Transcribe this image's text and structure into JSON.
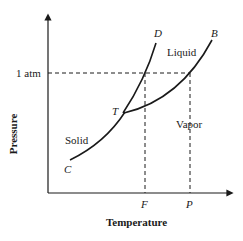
{
  "diagram": {
    "type": "phase-diagram",
    "axes": {
      "xlabel": "Temperature",
      "ylabel": "Pressure",
      "y_tick": "1 atm",
      "x_ticks": [
        "F",
        "P"
      ]
    },
    "regions": {
      "solid": "Solid",
      "liquid": "Liquid",
      "vapor": "Vapor"
    },
    "points": {
      "triple": "T",
      "sublimation_start": "C",
      "fusion_end": "D",
      "vaporization_end": "B"
    },
    "curves": [
      {
        "name": "sublimation",
        "from": "C",
        "to": "T"
      },
      {
        "name": "fusion",
        "from": "T",
        "to": "D"
      },
      {
        "name": "vaporization",
        "from": "T",
        "to": "B"
      }
    ],
    "colors": {
      "line": "#1a1a1a",
      "background": "#ffffff"
    }
  }
}
